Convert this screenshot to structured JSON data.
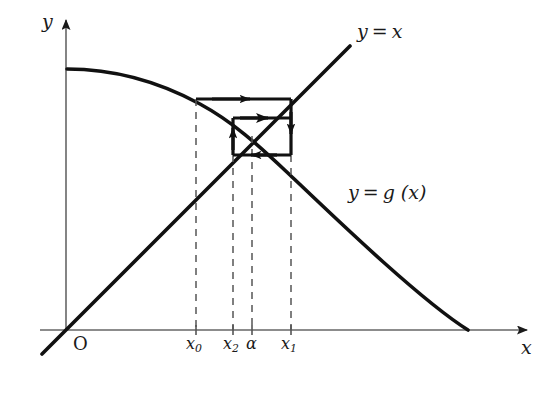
{
  "figure": {
    "axes": {
      "y_label": "y",
      "x_label": "x",
      "origin_label": "O",
      "x_axis_y": 330,
      "y_axis_x": 66,
      "x_axis_end": 535,
      "y_axis_top": 14
    },
    "curves": [
      {
        "name": "identity-line",
        "label_main": "y",
        "label_eq": "=",
        "label_arg": "x",
        "label_x": 357,
        "label_y": 24
      },
      {
        "name": "g-function-curve",
        "label_main": "y",
        "label_eq": "=",
        "label_arg": "g (x)",
        "label_x": 348,
        "label_y": 185
      }
    ],
    "ticks": [
      {
        "name": "x0",
        "base": "x",
        "sub": "0",
        "x": 196,
        "label_x": 187,
        "label_y": 338
      },
      {
        "name": "x2",
        "base": "x",
        "sub": "2",
        "x": 233,
        "label_x": 224,
        "label_y": 338
      },
      {
        "name": "alpha",
        "base": "α",
        "sub": "",
        "x": 252,
        "label_x": 247,
        "label_y": 338
      },
      {
        "name": "x1",
        "base": "x",
        "sub": "1",
        "x": 291,
        "label_x": 282,
        "label_y": 338
      }
    ],
    "cobweb": {
      "description": "staircase/spiral iteration path between y=g(x) and y=x",
      "segments": [
        {
          "name": "segment-h1",
          "dir": "right",
          "x1": 196,
          "y1": 99,
          "x2": 291,
          "y2": 99
        },
        {
          "name": "segment-v1",
          "dir": "down",
          "x1": 291,
          "y1": 99,
          "x2": 291,
          "y2": 155
        },
        {
          "name": "segment-h2",
          "dir": "left",
          "x1": 291,
          "y1": 155,
          "x2": 233,
          "y2": 155
        },
        {
          "name": "segment-v2",
          "dir": "up",
          "x1": 233,
          "y1": 155,
          "x2": 233,
          "y2": 118
        },
        {
          "name": "segment-h3",
          "dir": "right",
          "x1": 233,
          "y1": 118,
          "x2": 275,
          "y2": 118
        }
      ]
    },
    "dashed_drops": [
      {
        "name": "dash-x0",
        "x": 196,
        "y_top": 99,
        "y_bottom": 330
      },
      {
        "name": "dash-x2",
        "x": 233,
        "y_top": 155,
        "y_bottom": 330
      },
      {
        "name": "dash-alpha",
        "x": 252,
        "y_top": 136,
        "y_bottom": 330
      },
      {
        "name": "dash-x1",
        "x": 291,
        "y_top": 155,
        "y_bottom": 330
      }
    ],
    "fixed_point": {
      "name": "fixed-point-alpha",
      "x": 252,
      "y": 136
    }
  }
}
